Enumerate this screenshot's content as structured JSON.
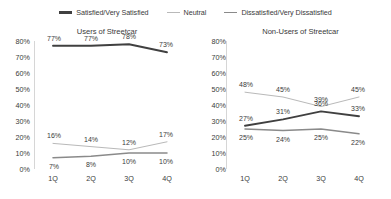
{
  "legend": {
    "items": [
      {
        "label": "Satisfied/Very Satisfied",
        "swatch": "line-swatch-satisfied",
        "color": "#404040"
      },
      {
        "label": "Neutral",
        "swatch": "line-swatch-neutral",
        "color": "#b9b9b9"
      },
      {
        "label": "Dissatisfied/Very Dissatisfied",
        "swatch": "line-swatch-dissatisfied",
        "color": "#8a8a8a"
      }
    ]
  },
  "chart_data": [
    {
      "type": "line",
      "title": "Users of Streetcar",
      "xlabel": "",
      "ylabel": "",
      "categories": [
        "1Q",
        "2Q",
        "3Q",
        "4Q"
      ],
      "ylim": [
        0,
        80
      ],
      "yticks": [
        "0%",
        "10%",
        "20%",
        "30%",
        "40%",
        "50%",
        "60%",
        "70%",
        "80%"
      ],
      "grid": false,
      "legend_position": "top-center-shared",
      "series": [
        {
          "name": "Satisfied/Very Satisfied",
          "color": "#404040",
          "values": [
            77,
            77,
            78,
            73
          ],
          "labels": [
            "77%",
            "77%",
            "78%",
            "73%"
          ]
        },
        {
          "name": "Neutral",
          "color": "#b9b9b9",
          "values": [
            16,
            14,
            12,
            17
          ],
          "labels": [
            "16%",
            "14%",
            "12%",
            "17%"
          ]
        },
        {
          "name": "Dissatisfied/Very Dissatisfied",
          "color": "#8a8a8a",
          "values": [
            7,
            8,
            10,
            10
          ],
          "labels": [
            "7%",
            "8%",
            "10%",
            "10%"
          ]
        }
      ]
    },
    {
      "type": "line",
      "title": "Non-Users of Streetcar",
      "xlabel": "",
      "ylabel": "",
      "categories": [
        "1Q",
        "2Q",
        "3Q",
        "4Q"
      ],
      "ylim": [
        0,
        80
      ],
      "yticks": [
        "0%",
        "10%",
        "20%",
        "30%",
        "40%",
        "50%",
        "60%",
        "70%",
        "80%"
      ],
      "grid": false,
      "legend_position": "top-center-shared",
      "series": [
        {
          "name": "Satisfied/Very Satisfied",
          "color": "#404040",
          "values": [
            27,
            31,
            36,
            33
          ],
          "labels": [
            "27%",
            "31%",
            "36%",
            "33%"
          ]
        },
        {
          "name": "Neutral",
          "color": "#b9b9b9",
          "values": [
            48,
            45,
            39,
            45
          ],
          "labels": [
            "48%",
            "45%",
            "39%",
            "45%"
          ]
        },
        {
          "name": "Dissatisfied/Very Dissatisfied",
          "color": "#8a8a8a",
          "values": [
            25,
            24,
            25,
            22
          ],
          "labels": [
            "25%",
            "24%",
            "25%",
            "22%"
          ]
        }
      ]
    }
  ]
}
